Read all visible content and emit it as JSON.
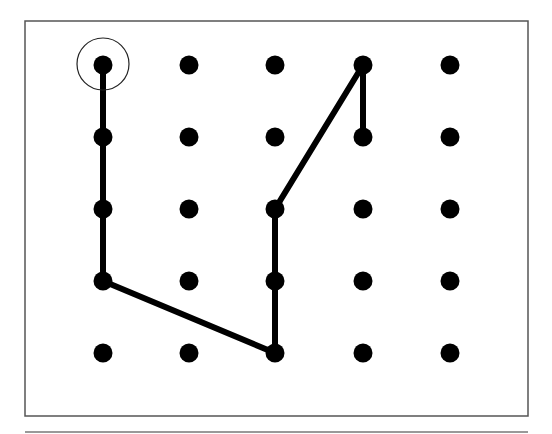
{
  "diagram": {
    "grid": {
      "columns": 5,
      "rows": 5,
      "x_positions": [
        103,
        189,
        275,
        363,
        450
      ],
      "y_positions": [
        65,
        137,
        209,
        281,
        353
      ],
      "dot_radius": 9.5,
      "dot_color": "#000000"
    },
    "frame": {
      "x": 25,
      "y": 21,
      "width": 503,
      "height": 395,
      "stroke": "#555555"
    },
    "bottom_rule": {
      "x1": 25,
      "x2": 528,
      "y": 432,
      "stroke": "#777777"
    },
    "path": {
      "stroke": "#000000",
      "width": 6,
      "points": [
        [
          0,
          0
        ],
        [
          0,
          1
        ],
        [
          0,
          2
        ],
        [
          0,
          3
        ],
        [
          2,
          4
        ],
        [
          2,
          3
        ],
        [
          2,
          2
        ],
        [
          3,
          0
        ],
        [
          3,
          1
        ]
      ]
    },
    "start_marker": {
      "col": 0,
      "row": 0,
      "radius": 26,
      "label": "start"
    }
  }
}
